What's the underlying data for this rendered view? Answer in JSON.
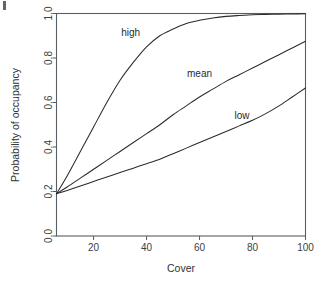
{
  "chart_data": {
    "type": "line",
    "title": "",
    "xlabel": "Cover",
    "ylabel": "Probability of occupancy",
    "xlim": [
      6,
      100
    ],
    "ylim": [
      0.0,
      1.0
    ],
    "xticks": [
      20,
      40,
      60,
      80,
      100
    ],
    "yticks": [
      "0.0",
      "0.2",
      "0.4",
      "0.6",
      "0.8",
      "1.0"
    ],
    "grid": false,
    "legend_position": "inline-labels",
    "x": [
      6,
      10,
      15,
      20,
      25,
      30,
      35,
      40,
      45,
      50,
      55,
      60,
      65,
      70,
      75,
      80,
      85,
      90,
      95,
      100
    ],
    "series": [
      {
        "name": "high",
        "label": "high",
        "values": [
          0.19,
          0.27,
          0.38,
          0.49,
          0.6,
          0.7,
          0.78,
          0.85,
          0.9,
          0.93,
          0.955,
          0.97,
          0.98,
          0.987,
          0.991,
          0.994,
          0.996,
          0.997,
          0.998,
          0.999
        ]
      },
      {
        "name": "mean",
        "label": "mean",
        "values": [
          0.19,
          0.22,
          0.26,
          0.3,
          0.34,
          0.38,
          0.42,
          0.46,
          0.5,
          0.545,
          0.585,
          0.625,
          0.66,
          0.695,
          0.725,
          0.755,
          0.785,
          0.815,
          0.845,
          0.875
        ]
      },
      {
        "name": "low",
        "label": "low",
        "values": [
          0.19,
          0.205,
          0.225,
          0.245,
          0.265,
          0.285,
          0.305,
          0.325,
          0.345,
          0.37,
          0.395,
          0.42,
          0.445,
          0.47,
          0.495,
          0.52,
          0.55,
          0.585,
          0.625,
          0.665
        ]
      }
    ],
    "annotations": [
      {
        "text": "high",
        "x": 34,
        "y": 0.9
      },
      {
        "text": "mean",
        "x": 60,
        "y": 0.715
      },
      {
        "text": "low",
        "x": 76,
        "y": 0.525
      }
    ],
    "colors": {
      "line": "#2b2b2b",
      "axis": "#555a5e",
      "text": "#2f3336",
      "background": "#ffffff"
    }
  }
}
